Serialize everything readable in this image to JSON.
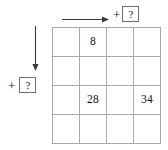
{
  "puzzle": {
    "type": "arithmetic-grid-puzzle",
    "grid": {
      "rows": 4,
      "cols": 4,
      "cells": [
        [
          "",
          "8",
          "",
          ""
        ],
        [
          "",
          "",
          "",
          ""
        ],
        [
          "",
          "28",
          "",
          "34"
        ],
        [
          "",
          "",
          "",
          ""
        ]
      ]
    },
    "top_operation": {
      "arrow": "right-arrow",
      "operator": "+",
      "unknown": "?"
    },
    "left_operation": {
      "arrow": "down-arrow",
      "operator": "+",
      "unknown": "?"
    },
    "colors": {
      "grid_line": "#a9a9a9",
      "box_border": "#6e6e6e",
      "ink": "#111111",
      "background": "#ffffff"
    }
  }
}
